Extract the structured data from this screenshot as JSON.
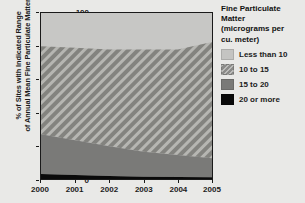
{
  "chart_data": {
    "type": "area",
    "title": "",
    "subtitle": "",
    "xlabel": "",
    "ylabel": "% of Sites with Indicated Range of Annual Mean Fine Particulate Matter",
    "ylabel_line1": "% of Sites with Indicated Range",
    "ylabel_line2": "of Annual Mean Fine Particulate Matter",
    "stacked": true,
    "stack_total": 100,
    "grid": false,
    "legend_position": "right",
    "x": [
      2000,
      2001,
      2002,
      2003,
      2004,
      2005
    ],
    "categories": [
      "2000",
      "2001",
      "2002",
      "2003",
      "2004",
      "2005"
    ],
    "xlim": [
      2000,
      2005
    ],
    "ylim": [
      0,
      100
    ],
    "yticks": [
      0,
      20,
      40,
      60,
      80,
      100
    ],
    "xticks": [
      "2000",
      "2001",
      "2002",
      "2003",
      "2004",
      "2005"
    ],
    "series": [
      {
        "name": "20 or more",
        "color": "#0a0a0a",
        "pattern": "solid",
        "values": [
          3,
          2.4,
          1.8,
          1.4,
          1.2,
          1
        ]
      },
      {
        "name": "15 to 20",
        "color": "#7a7a78",
        "pattern": "solid",
        "values": [
          24,
          21,
          18,
          15,
          13.3,
          11.5
        ]
      },
      {
        "name": "10 to 15",
        "color": "#8b8b89",
        "pattern": "diagonal-hatch",
        "values": [
          53,
          55.6,
          58.2,
          61.6,
          63.5,
          70
        ]
      },
      {
        "name": "Less than 10",
        "color": "#c4c4c2",
        "pattern": "solid",
        "values": [
          20,
          21,
          22,
          22,
          22,
          17.5
        ]
      }
    ],
    "cumulative_tops": {
      "20 or more": [
        3,
        2.4,
        1.8,
        1.4,
        1.2,
        1
      ],
      "15 to 20": [
        27,
        23.4,
        19.8,
        16.4,
        14.5,
        12.5
      ],
      "10 to 15": [
        80,
        79,
        78,
        78,
        78,
        82.5
      ],
      "Less than 10": [
        100,
        100,
        100,
        100,
        100,
        100
      ]
    }
  },
  "legend": {
    "title_line1": "Fine Particulate",
    "title_line2": "Matter",
    "title_line3": "(micrograms per",
    "title_line4": "cu. meter)",
    "items": [
      {
        "label": "Less than 10",
        "swatch": "light-gray"
      },
      {
        "label": "10 to 15",
        "swatch": "hatched-gray"
      },
      {
        "label": "15 to 20",
        "swatch": "medium-gray"
      },
      {
        "label": "20 or more",
        "swatch": "black"
      }
    ]
  },
  "colors": {
    "background": "#e9e9e7",
    "less_than_10": "#c4c4c2",
    "ten_to_15": "#8b8b89",
    "fifteen_to_20": "#7a7a78",
    "twenty_or_more": "#0a0a0a",
    "axis": "#1a1a1a",
    "text": "#1b1b1b"
  }
}
